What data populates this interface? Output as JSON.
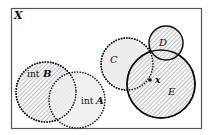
{
  "diagram": {
    "space_label": "X",
    "frame": {
      "x": 11,
      "y": 8,
      "width": 191,
      "height": 121,
      "stroke": "#555555"
    },
    "sets": [
      {
        "id": "B",
        "prefix": "int",
        "name": "B",
        "label": "int B",
        "cx": 46,
        "cy": 92,
        "r": 30,
        "style": "dotted",
        "fill": "hatched"
      },
      {
        "id": "A",
        "prefix": "int",
        "name": "A",
        "label": "int A",
        "cx": 77,
        "cy": 100,
        "r": 28,
        "style": "dotted",
        "fill": "light"
      },
      {
        "id": "C",
        "name": "C",
        "label": "C",
        "cx": 127,
        "cy": 64,
        "r": 26,
        "style": "dotted",
        "fill": "light"
      },
      {
        "id": "D",
        "name": "D",
        "label": "D",
        "cx": 166,
        "cy": 43,
        "r": 17,
        "style": "solid",
        "fill": "hatched"
      },
      {
        "id": "E",
        "name": "E",
        "label": "E",
        "cx": 161,
        "cy": 84,
        "r": 34,
        "style": "solid",
        "fill": "hatched"
      }
    ],
    "point": {
      "label": "x",
      "cx": 150,
      "cy": 80
    },
    "colors": {
      "stroke": "#111111",
      "hatch": "#9a9a9a",
      "light_fill": "#ededed"
    }
  }
}
